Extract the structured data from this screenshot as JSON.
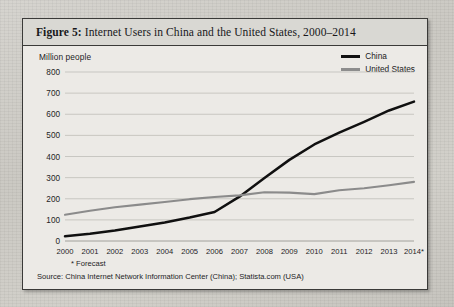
{
  "figure": {
    "label": "Figure 5:",
    "caption": "Internet Users in China and the United States, 2000–2014"
  },
  "footnote": "* Forecast",
  "source": "Source: China Internet Network Information Center (China); Statista.com (USA)",
  "legend": {
    "items": [
      {
        "name": "China",
        "color": "#101010"
      },
      {
        "name": "United States",
        "color": "#8b8b8b"
      }
    ]
  },
  "chart_data": {
    "type": "line",
    "title": "Internet Users in China and the United States, 2000–2014",
    "xlabel": "",
    "ylabel": "Million people",
    "ylim": [
      0,
      800
    ],
    "ytick_values": [
      0,
      100,
      200,
      300,
      400,
      500,
      600,
      700,
      800
    ],
    "grid": true,
    "legend_position": "top-right",
    "categories": [
      "2000",
      "2001",
      "2002",
      "2003",
      "2004",
      "2005",
      "2006",
      "2007",
      "2008",
      "2009",
      "2010",
      "2011",
      "2012",
      "2013",
      "2014*"
    ],
    "annotations": [
      "* Forecast"
    ],
    "series": [
      {
        "name": "China",
        "color": "#101010",
        "values": [
          22,
          34,
          50,
          69,
          88,
          111,
          137,
          210,
          298,
          384,
          457,
          513,
          564,
          618,
          660
        ]
      },
      {
        "name": "United States",
        "color": "#8b8b8b",
        "values": [
          124,
          143,
          160,
          172,
          185,
          198,
          208,
          216,
          231,
          229,
          222,
          240,
          250,
          264,
          280
        ]
      }
    ]
  }
}
